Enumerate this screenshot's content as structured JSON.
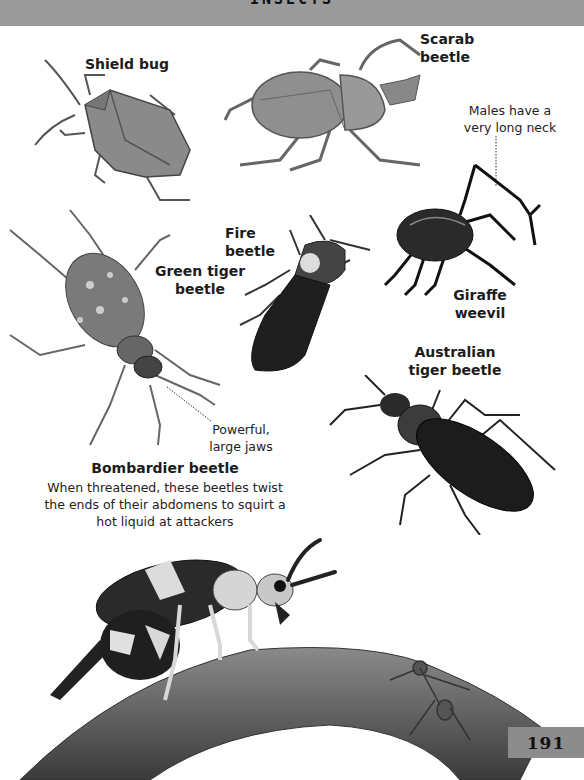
{
  "header": {
    "title": "INSECTS",
    "band_color": "#9a9a9a"
  },
  "specimens": [
    {
      "id": "shield-bug",
      "label": "Shield bug"
    },
    {
      "id": "scarab-beetle",
      "label_line1": "Scarab",
      "label_line2": "beetle"
    },
    {
      "id": "giraffe-weevil",
      "label_line1": "Giraffe",
      "label_line2": "weevil",
      "annotation_line1": "Males have a",
      "annotation_line2": "very long neck"
    },
    {
      "id": "fire-beetle",
      "label": "Fire beetle"
    },
    {
      "id": "green-tiger-beetle",
      "label_line1": "Green tiger",
      "label_line2": "beetle",
      "annotation_line1": "Powerful,",
      "annotation_line2": "large jaws"
    },
    {
      "id": "australian-tiger-beetle",
      "label_line1": "Australian",
      "label_line2": "tiger beetle"
    }
  ],
  "bombardier": {
    "title": "Bombardier beetle",
    "line1": "When threatened, these beetles twist",
    "line2": "the ends of their abdomens to squirt a",
    "line3": "hot liquid at attackers"
  },
  "page": {
    "number": "191",
    "tab_color": "#8c8c8c"
  }
}
